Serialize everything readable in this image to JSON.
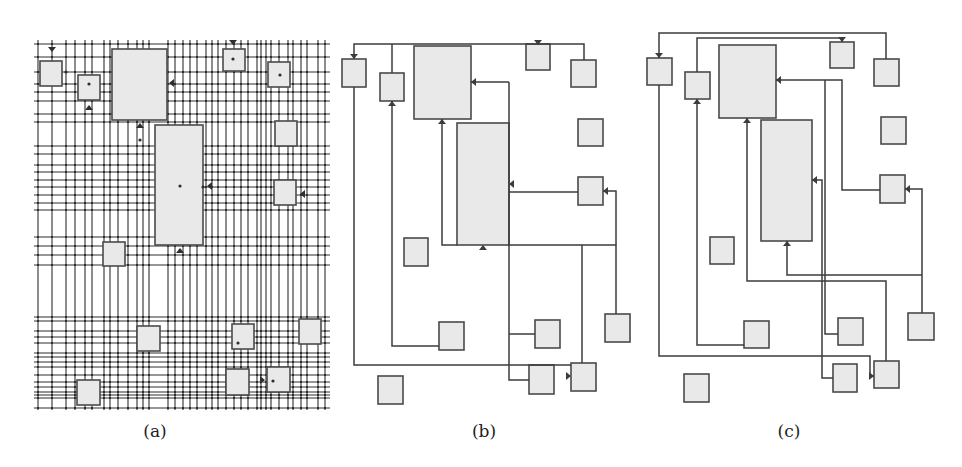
{
  "figure": {
    "panels": [
      {
        "id": "a",
        "caption": "(a)",
        "caption_x": 155,
        "description": "Dense orthogonal routing grid with all candidate track lines",
        "blocks": [
          {
            "x": 40,
            "y": 61,
            "w": 22,
            "h": 25
          },
          {
            "x": 78,
            "y": 75,
            "w": 22,
            "h": 25
          },
          {
            "x": 112,
            "y": 49,
            "w": 55,
            "h": 71
          },
          {
            "x": 155,
            "y": 125,
            "w": 48,
            "h": 120
          },
          {
            "x": 223,
            "y": 49,
            "w": 22,
            "h": 22
          },
          {
            "x": 268,
            "y": 62,
            "w": 22,
            "h": 25
          },
          {
            "x": 275,
            "y": 121,
            "w": 22,
            "h": 25
          },
          {
            "x": 274,
            "y": 180,
            "w": 22,
            "h": 25
          },
          {
            "x": 103,
            "y": 242,
            "w": 22,
            "h": 24
          },
          {
            "x": 137,
            "y": 326,
            "w": 23,
            "h": 25
          },
          {
            "x": 232,
            "y": 324,
            "w": 22,
            "h": 25
          },
          {
            "x": 299,
            "y": 319,
            "w": 22,
            "h": 25
          },
          {
            "x": 77,
            "y": 380,
            "w": 23,
            "h": 25
          },
          {
            "x": 226,
            "y": 369,
            "w": 23,
            "h": 26
          },
          {
            "x": 267,
            "y": 367,
            "w": 23,
            "h": 25
          }
        ],
        "hlines": [
          44,
          57,
          72,
          84,
          92,
          101,
          114,
          122,
          146,
          154,
          165,
          172,
          180,
          187,
          195,
          203,
          210,
          237,
          246,
          255,
          265,
          317,
          321,
          331,
          337,
          343,
          353,
          357,
          362,
          367,
          375,
          382,
          387,
          392,
          395,
          398,
          408
        ],
        "vlines": [
          38,
          52,
          66,
          75,
          85,
          92,
          104,
          110,
          118,
          128,
          137,
          143,
          149,
          168,
          175,
          183,
          190,
          197,
          206,
          212,
          218,
          226,
          234,
          241,
          248,
          257,
          261,
          266,
          271,
          279,
          288,
          293,
          301,
          307,
          318,
          325
        ],
        "grid_box": {
          "x1": 34,
          "y1": 40,
          "x2": 330,
          "y2": 410
        }
      },
      {
        "id": "b",
        "caption": "(b)",
        "caption_x": 484,
        "description": "Routed nets result, method B",
        "blocks": [
          {
            "x": 342,
            "y": 59,
            "w": 24,
            "h": 28
          },
          {
            "x": 380,
            "y": 73,
            "w": 24,
            "h": 28
          },
          {
            "x": 414,
            "y": 46,
            "w": 57,
            "h": 73
          },
          {
            "x": 457,
            "y": 123,
            "w": 52,
            "h": 122
          },
          {
            "x": 526,
            "y": 44,
            "w": 24,
            "h": 26
          },
          {
            "x": 571,
            "y": 60,
            "w": 25,
            "h": 27
          },
          {
            "x": 578,
            "y": 119,
            "w": 25,
            "h": 27
          },
          {
            "x": 578,
            "y": 177,
            "w": 25,
            "h": 28
          },
          {
            "x": 404,
            "y": 238,
            "w": 24,
            "h": 28
          },
          {
            "x": 439,
            "y": 322,
            "w": 25,
            "h": 28
          },
          {
            "x": 535,
            "y": 320,
            "w": 25,
            "h": 28
          },
          {
            "x": 605,
            "y": 314,
            "w": 25,
            "h": 28
          },
          {
            "x": 378,
            "y": 376,
            "w": 25,
            "h": 28
          },
          {
            "x": 529,
            "y": 365,
            "w": 25,
            "h": 29
          },
          {
            "x": 571,
            "y": 363,
            "w": 25,
            "h": 28
          }
        ],
        "wires": [
          "M354,59 L354,44 L584,44 L584,60",
          "M392,73 L392,44",
          "M538,44 L538,44",
          "M354,87 L354,365 L571,365",
          "M392,101 L392,346 L439,346",
          "M442,119 L442,245 L457,245",
          "M509,82 L509,245 L616,245 L616,314",
          "M471,82 L509,82",
          "M509,192 L578,192",
          "M603,191 L616,191 L616,245",
          "M582,245 L582,363",
          "M509,245 L509,380 L529,380",
          "M509,334 L535,334"
        ],
        "arrows": [
          {
            "x": 354,
            "y": 58,
            "dir": "down"
          },
          {
            "x": 392,
            "y": 102,
            "dir": "up"
          },
          {
            "x": 538,
            "y": 44,
            "dir": "down"
          },
          {
            "x": 442,
            "y": 120,
            "dir": "up"
          },
          {
            "x": 472,
            "y": 82,
            "dir": "left"
          },
          {
            "x": 510,
            "y": 184,
            "dir": "left"
          },
          {
            "x": 604,
            "y": 191,
            "dir": "left"
          },
          {
            "x": 483,
            "y": 246,
            "dir": "up"
          },
          {
            "x": 570,
            "y": 376,
            "dir": "right"
          }
        ]
      },
      {
        "id": "c",
        "caption": "(c)",
        "caption_x": 789,
        "description": "Routed nets result, method C",
        "blocks": [
          {
            "x": 647,
            "y": 58,
            "w": 25,
            "h": 27
          },
          {
            "x": 685,
            "y": 72,
            "w": 25,
            "h": 27
          },
          {
            "x": 719,
            "y": 45,
            "w": 57,
            "h": 73
          },
          {
            "x": 761,
            "y": 120,
            "w": 51,
            "h": 121
          },
          {
            "x": 830,
            "y": 42,
            "w": 24,
            "h": 26
          },
          {
            "x": 874,
            "y": 59,
            "w": 25,
            "h": 27
          },
          {
            "x": 881,
            "y": 117,
            "w": 25,
            "h": 27
          },
          {
            "x": 880,
            "y": 175,
            "w": 25,
            "h": 28
          },
          {
            "x": 710,
            "y": 237,
            "w": 24,
            "h": 27
          },
          {
            "x": 744,
            "y": 321,
            "w": 25,
            "h": 27
          },
          {
            "x": 838,
            "y": 318,
            "w": 25,
            "h": 27
          },
          {
            "x": 908,
            "y": 313,
            "w": 26,
            "h": 27
          },
          {
            "x": 684,
            "y": 374,
            "w": 25,
            "h": 28
          },
          {
            "x": 833,
            "y": 364,
            "w": 24,
            "h": 28
          },
          {
            "x": 874,
            "y": 361,
            "w": 25,
            "h": 27
          }
        ],
        "wires": [
          "M659,58 L659,33 L886,33 L886,59",
          "M697,72 L697,38 L842,38 L842,42",
          "M659,85 L659,356 L870,356 L870,376 L874,376",
          "M697,99 L697,345 L744,345",
          "M747,118 L747,281 L886,281 L886,361",
          "M776,80 L842,80 L842,190 L880,190",
          "M825,80 L825,334 L838,334",
          "M812,180 L822,180 L822,378 L833,378",
          "M905,189 L922,189 L922,313",
          "M787,241 L787,275 L922,275"
        ],
        "arrows": [
          {
            "x": 659,
            "y": 57,
            "dir": "down"
          },
          {
            "x": 842,
            "y": 41,
            "dir": "down"
          },
          {
            "x": 697,
            "y": 100,
            "dir": "up"
          },
          {
            "x": 747,
            "y": 119,
            "dir": "up"
          },
          {
            "x": 777,
            "y": 80,
            "dir": "left"
          },
          {
            "x": 813,
            "y": 180,
            "dir": "left"
          },
          {
            "x": 906,
            "y": 189,
            "dir": "left"
          },
          {
            "x": 787,
            "y": 242,
            "dir": "up"
          },
          {
            "x": 873,
            "y": 376,
            "dir": "right"
          }
        ]
      }
    ],
    "colors": {
      "block_fill": "#e9e9e9",
      "block_stroke": "#4a4a4a",
      "wire": "#3c3c3c",
      "grid": "#2e2e2e"
    }
  }
}
